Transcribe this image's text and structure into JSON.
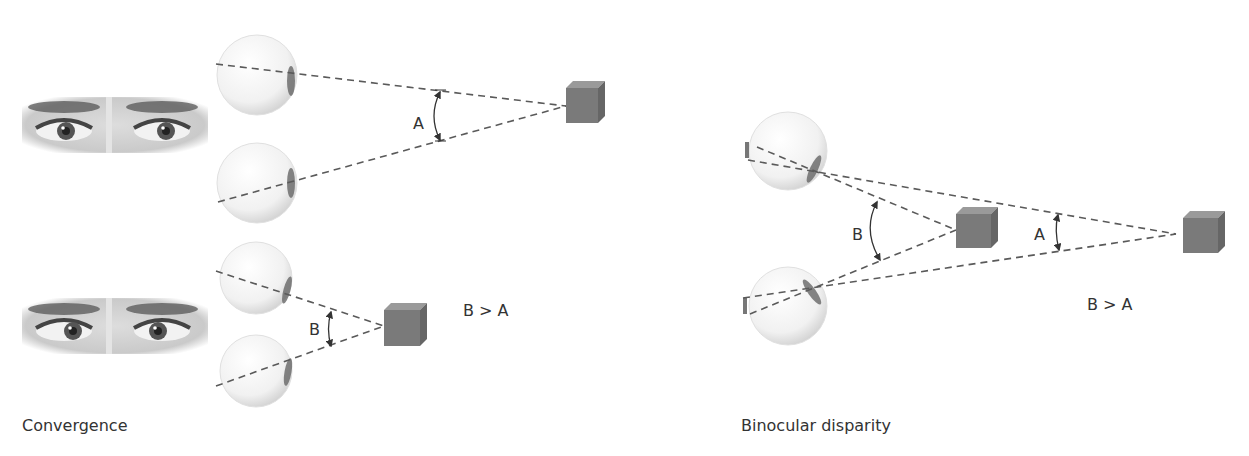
{
  "panels": {
    "convergence": {
      "caption": "Convergence",
      "far_case": {
        "angle_label": "A"
      },
      "near_case": {
        "angle_label": "B"
      },
      "comparison": "B > A"
    },
    "binocular_disparity": {
      "caption": "Binocular disparity",
      "near_angle_label": "B",
      "far_angle_label": "A",
      "comparison": "B > A"
    }
  },
  "colors": {
    "background": "#ffffff",
    "dashed_line": "#5a5a5a",
    "cube_front": "#7a7a7a",
    "cube_top": "#9a9a9a",
    "cube_side": "#666666",
    "text": "#333333"
  }
}
